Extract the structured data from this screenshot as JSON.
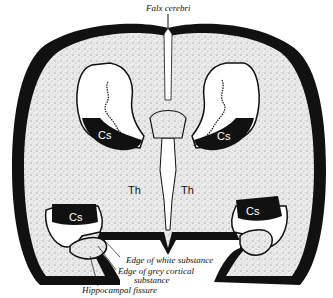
{
  "figure": {
    "colors": {
      "background": "#ffffff",
      "cortex_fill": "#e8e8e8",
      "outline": "#111111",
      "white_text": "#ffffff"
    },
    "labels": {
      "falx_cerebri": "Falx cerebri",
      "edge_white": "Edge of white substance",
      "edge_grey_1": "Edge of grey cortical",
      "edge_grey_2": "substance",
      "hippocampal_fissure": "Hippocampal fissure"
    },
    "region_labels": {
      "cs_upper_left": "Cs",
      "cs_upper_right": "Cs",
      "cs_lower_left": "Cs",
      "cs_lower_right": "Cs",
      "th_left": "Th",
      "th_right": "Th"
    }
  }
}
